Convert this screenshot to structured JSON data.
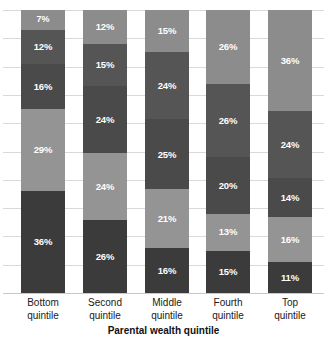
{
  "chart_data": {
    "type": "bar",
    "subtype": "stacked-100-percent",
    "title": "",
    "xlabel": "Parental wealth quintile",
    "ylabel": "",
    "ylim": [
      0,
      100
    ],
    "grid": true,
    "grid_interval": 10,
    "legend": "none",
    "categories": [
      "Bottom quintile",
      "Second quintile",
      "Middle quintile",
      "Fourth quintile",
      "Top quintile"
    ],
    "category_lines": [
      [
        "Bottom",
        "quintile"
      ],
      [
        "Second",
        "quintile"
      ],
      [
        "Middle",
        "quintile"
      ],
      [
        "Fourth",
        "quintile"
      ],
      [
        "Top",
        "quintile"
      ]
    ],
    "series": [
      {
        "name": "Top quintile",
        "color": "#8c8c8c",
        "stack_order": 1,
        "values": [
          7,
          12,
          15,
          26,
          36
        ],
        "labels": [
          "7%",
          "12%",
          "15%",
          "26%",
          "36%"
        ]
      },
      {
        "name": "Fourth quintile",
        "color": "#555555",
        "stack_order": 2,
        "values": [
          12,
          15,
          24,
          26,
          24
        ],
        "labels": [
          "12%",
          "15%",
          "24%",
          "26%",
          "24%"
        ]
      },
      {
        "name": "Middle quintile",
        "color": "#4a4a4a",
        "stack_order": 3,
        "values": [
          16,
          24,
          25,
          20,
          14
        ],
        "labels": [
          "16%",
          "24%",
          "25%",
          "20%",
          "14%"
        ]
      },
      {
        "name": "Second quintile",
        "color": "#949494",
        "stack_order": 4,
        "values": [
          29,
          24,
          21,
          13,
          16
        ],
        "labels": [
          "29%",
          "24%",
          "21%",
          "13%",
          "16%"
        ]
      },
      {
        "name": "Bottom quintile",
        "color": "#3b3b3b",
        "stack_order": 5,
        "values": [
          36,
          26,
          16,
          15,
          11
        ],
        "labels": [
          "36%",
          "26%",
          "16%",
          "15%",
          "11%"
        ]
      }
    ],
    "columns": [
      {
        "category": "Bottom quintile",
        "segments": [
          {
            "label": "7%",
            "value": 7,
            "color": "#8c8c8c"
          },
          {
            "label": "12%",
            "value": 12,
            "color": "#555555"
          },
          {
            "label": "16%",
            "value": 16,
            "color": "#4a4a4a"
          },
          {
            "label": "29%",
            "value": 29,
            "color": "#949494"
          },
          {
            "label": "36%",
            "value": 36,
            "color": "#3b3b3b"
          }
        ]
      },
      {
        "category": "Second quintile",
        "segments": [
          {
            "label": "12%",
            "value": 12,
            "color": "#8c8c8c"
          },
          {
            "label": "15%",
            "value": 15,
            "color": "#555555"
          },
          {
            "label": "24%",
            "value": 24,
            "color": "#4a4a4a"
          },
          {
            "label": "24%",
            "value": 24,
            "color": "#949494"
          },
          {
            "label": "26%",
            "value": 26,
            "color": "#3b3b3b"
          }
        ]
      },
      {
        "category": "Middle quintile",
        "segments": [
          {
            "label": "15%",
            "value": 15,
            "color": "#8c8c8c"
          },
          {
            "label": "24%",
            "value": 24,
            "color": "#555555"
          },
          {
            "label": "25%",
            "value": 25,
            "color": "#4a4a4a"
          },
          {
            "label": "21%",
            "value": 21,
            "color": "#949494"
          },
          {
            "label": "16%",
            "value": 16,
            "color": "#3b3b3b"
          }
        ]
      },
      {
        "category": "Fourth quintile",
        "segments": [
          {
            "label": "26%",
            "value": 26,
            "color": "#8c8c8c"
          },
          {
            "label": "26%",
            "value": 26,
            "color": "#555555"
          },
          {
            "label": "20%",
            "value": 20,
            "color": "#4a4a4a"
          },
          {
            "label": "13%",
            "value": 13,
            "color": "#949494"
          },
          {
            "label": "15%",
            "value": 15,
            "color": "#3b3b3b"
          }
        ]
      },
      {
        "category": "Top quintile",
        "segments": [
          {
            "label": "36%",
            "value": 36,
            "color": "#8c8c8c"
          },
          {
            "label": "24%",
            "value": 24,
            "color": "#555555"
          },
          {
            "label": "14%",
            "value": 14,
            "color": "#4a4a4a"
          },
          {
            "label": "16%",
            "value": 16,
            "color": "#949494"
          },
          {
            "label": "11%",
            "value": 11,
            "color": "#3b3b3b"
          }
        ]
      }
    ],
    "colors": {
      "grid": "#d9d9d9",
      "axis": "#c8c8c8",
      "label_text": "#ffffff",
      "category_text": "#1a1a1a",
      "background": "#ffffff"
    }
  }
}
